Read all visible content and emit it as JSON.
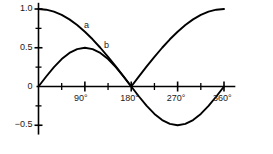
{
  "chart_data": {
    "type": "line",
    "title": "",
    "xlabel": "",
    "ylabel": "",
    "xlim": [
      0,
      360
    ],
    "ylim": [
      -0.65,
      1.05
    ],
    "grid": false,
    "legend_position": "inline-curve-labels",
    "x_ticks": [
      0,
      45,
      90,
      135,
      180,
      225,
      270,
      315,
      360
    ],
    "x_tick_labels": [
      "",
      "",
      "90°",
      "",
      "180°",
      "",
      "270°",
      "",
      "360°"
    ],
    "y_ticks": [
      -0.5,
      -0.25,
      0,
      0.25,
      0.5,
      0.75,
      1.0
    ],
    "y_tick_labels": [
      "−0.5",
      "",
      "0",
      "",
      "0.5",
      "",
      "1.0"
    ],
    "series": [
      {
        "name": "a",
        "label": "a",
        "expression": "(1 + cos(x)) / 2 scaled curve from 1.0 down to 0 at 180° and back to 1.0 at 360°",
        "color": "#000000",
        "x": [
          0,
          15,
          30,
          45,
          60,
          75,
          90,
          105,
          120,
          135,
          150,
          165,
          180,
          195,
          210,
          225,
          240,
          255,
          270,
          285,
          300,
          315,
          330,
          345,
          360
        ],
        "values": [
          1.0,
          0.991,
          0.966,
          0.924,
          0.866,
          0.793,
          0.707,
          0.609,
          0.5,
          0.383,
          0.259,
          0.131,
          0.0,
          0.131,
          0.259,
          0.383,
          0.5,
          0.609,
          0.707,
          0.793,
          0.866,
          0.924,
          0.966,
          0.991,
          1.0
        ]
      },
      {
        "name": "b",
        "label": "b",
        "expression": "0.5 * sin(x)",
        "color": "#000000",
        "x": [
          0,
          15,
          30,
          45,
          60,
          75,
          90,
          105,
          120,
          135,
          150,
          165,
          180,
          195,
          210,
          225,
          240,
          255,
          270,
          285,
          300,
          315,
          330,
          345,
          360
        ],
        "values": [
          0.0,
          0.129,
          0.25,
          0.354,
          0.433,
          0.483,
          0.5,
          0.483,
          0.433,
          0.354,
          0.25,
          0.129,
          0.0,
          -0.129,
          -0.25,
          -0.354,
          -0.433,
          -0.483,
          -0.5,
          -0.483,
          -0.433,
          -0.354,
          -0.25,
          -0.129,
          0.0
        ]
      }
    ],
    "annotations": [
      {
        "name": "curve-label-a",
        "text": "a",
        "x": 92,
        "y": 0.78
      },
      {
        "name": "curve-label-b",
        "text": "b",
        "x": 131,
        "y": 0.52
      }
    ]
  },
  "axis": {
    "y_labels": [
      {
        "text": "1.0",
        "value": 1.0
      },
      {
        "text": "0.5",
        "value": 0.5
      },
      {
        "text": "0",
        "value": 0
      },
      {
        "text": "−0.5",
        "value": -0.5
      }
    ],
    "x_labels": [
      {
        "text": "90°",
        "value": 90
      },
      {
        "text": "180°",
        "value": 180
      },
      {
        "text": "270°",
        "value": 270
      },
      {
        "text": "360°",
        "value": 360
      }
    ]
  },
  "style": {
    "axis_color": "#000000",
    "curve_color": "#000000",
    "background": "#ffffff"
  }
}
